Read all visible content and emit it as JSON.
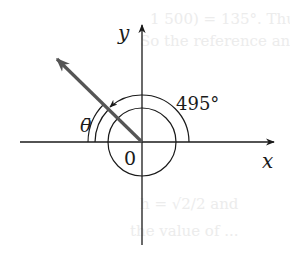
{
  "diagram": {
    "axes": {
      "x_label": "x",
      "y_label": "y",
      "origin_label": "0"
    },
    "angle": {
      "value_label": "495°",
      "degrees": 495,
      "reference_angle_label": "θ̄",
      "terminal_quadrant": "II"
    },
    "colors": {
      "axis": "#1a1a1a",
      "terminal_ray": "#555555",
      "arc": "#1a1a1a",
      "background": "#ffffff",
      "bleed_text": "#ececec"
    }
  },
  "bleed_text": {
    "line1": "1 500) = 135°. Thus the",
    "line2": "So the reference angle is",
    "line3": "h = √2/2 and",
    "line4": "the value of ..."
  }
}
